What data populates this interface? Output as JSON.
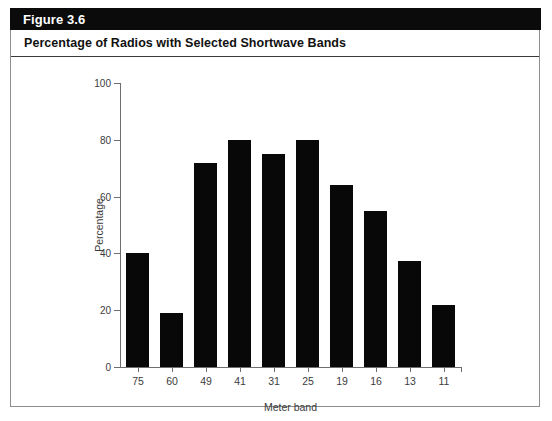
{
  "figure": {
    "header_label": "Figure 3.6",
    "title": "Percentage of Radios with Selected Shortwave Bands",
    "header_bg": "#0b0b0b",
    "header_text_color": "#ffffff",
    "bar_color": "#080808",
    "axis_color": "#6e6e6e",
    "panel_border": "#8d8d8d"
  },
  "chart_data": {
    "type": "bar",
    "title": "Percentage of Radios with Selected Shortwave Bands",
    "subtitle": "",
    "xlabel": "Meter band",
    "ylabel": "Percentage",
    "categories": [
      "75",
      "60",
      "49",
      "41",
      "31",
      "25",
      "19",
      "16",
      "13",
      "11"
    ],
    "values": [
      40,
      19,
      72,
      80,
      75,
      80,
      64,
      55,
      37.5,
      22
    ],
    "ylim": [
      0,
      100
    ],
    "yticks": [
      0,
      20,
      40,
      60,
      80,
      100
    ],
    "ytick_labels": [
      "0",
      "20",
      "40",
      "60",
      "80",
      "100"
    ],
    "grid": false,
    "legend": null,
    "legend_position": "none",
    "series": [
      {
        "name": "Percentage",
        "values": [
          40,
          19,
          72,
          80,
          75,
          80,
          64,
          55,
          37.5,
          22
        ]
      }
    ],
    "annotations": []
  }
}
